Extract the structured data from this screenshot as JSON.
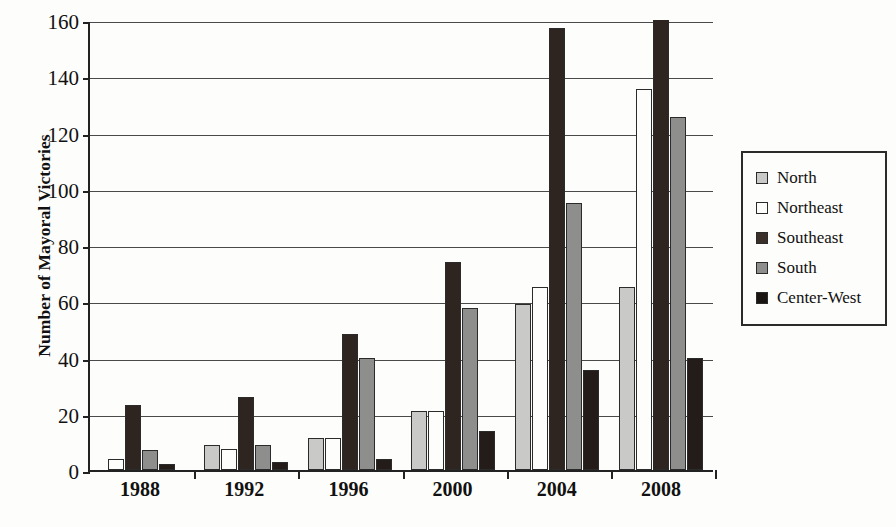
{
  "chart_data": {
    "type": "bar",
    "title": "",
    "xlabel": "",
    "ylabel": "Number of Mayoral Victories",
    "ylim": [
      0,
      160
    ],
    "ytick_values": [
      0,
      20,
      40,
      60,
      80,
      100,
      120,
      140,
      160
    ],
    "ytick_labels": [
      "0",
      "20",
      "40",
      "60",
      "80",
      "100",
      "120",
      "140",
      "160"
    ],
    "grid": true,
    "legend_position": "right",
    "categories": [
      "1988",
      "1992",
      "1996",
      "2000",
      "2004",
      "2008"
    ],
    "series": [
      {
        "name": "North",
        "color": "#c9c9c7",
        "values": [
          0,
          9,
          11.5,
          21,
          59,
          65
        ]
      },
      {
        "name": "Northeast",
        "color": "#fdfdfb",
        "values": [
          4,
          7.5,
          11.5,
          21,
          65,
          135.5
        ]
      },
      {
        "name": "Southeast",
        "color": "#2e2420",
        "values": [
          23,
          26,
          48.5,
          74,
          157,
          162
        ]
      },
      {
        "name": "South",
        "color": "#8e8e8c",
        "values": [
          7,
          9,
          40,
          57.5,
          95,
          125.5
        ]
      },
      {
        "name": "Center-West",
        "color": "#231c19",
        "values": [
          2,
          3,
          4,
          14,
          35.5,
          40
        ]
      }
    ],
    "notes": {
      "clipped_series": "Southeast 2008 extends beyond the top of the plot area (>160)"
    }
  },
  "legend": {
    "entries": [
      {
        "label": "North",
        "swatch": "north-swatch"
      },
      {
        "label": "Northeast",
        "swatch": "northeast-swatch"
      },
      {
        "label": "Southeast",
        "swatch": "southeast-swatch"
      },
      {
        "label": "South",
        "swatch": "south-swatch"
      },
      {
        "label": "Center-West",
        "swatch": "centerwest-swatch"
      }
    ]
  }
}
